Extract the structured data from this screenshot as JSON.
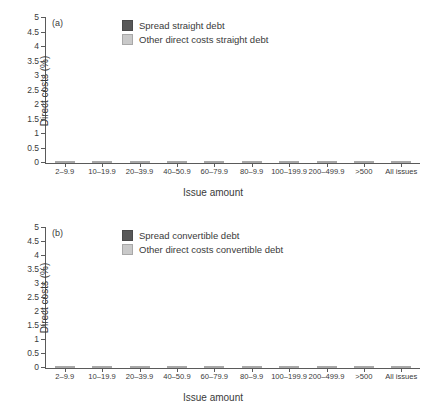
{
  "figure": {
    "background": "#ffffff",
    "colors": {
      "spread": "#585858",
      "other": "#c9c9c9",
      "axis": "#5a5a5a",
      "text": "#3a3a3a"
    },
    "top_cut_text": ""
  },
  "panels": [
    {
      "tag": "(a)",
      "legend": [
        {
          "label": "Spread straight debt",
          "color": "#585858",
          "key": "spread"
        },
        {
          "label": "Other direct costs straight debt",
          "color": "#c9c9c9",
          "key": "other"
        }
      ],
      "chart_data": {
        "type": "bar",
        "stacked": true,
        "title": "",
        "xlabel": "Issue amount",
        "ylabel": "Direct costs (%)",
        "ylim": [
          0,
          5
        ],
        "yticks": [
          "0",
          "0.5",
          "1",
          "1.5",
          "2",
          "2.5",
          "3",
          "3.5",
          "4",
          "4.5",
          "5"
        ],
        "grid": false,
        "legend_position": "top-center",
        "categories": [
          "2–9.9",
          "10–19.9",
          "20–39.9",
          "40–50.9",
          "60–79.9",
          "80–9.9",
          "100–199.9",
          "200–499.9",
          ">500",
          "All issues"
        ],
        "series": [
          {
            "name": "Spread straight debt",
            "color": "#585858",
            "values": [
              2.04,
              1.35,
              1.51,
              0.69,
              1.74,
              1.53,
              1.76,
              1.8,
              1.38,
              1.61
            ]
          },
          {
            "name": "Other direct costs straight debt",
            "color": "#c9c9c9",
            "values": [
              2.35,
              1.43,
              0.93,
              0.65,
              0.63,
              0.69,
              0.6,
              0.43,
              0.31,
              0.67
            ]
          }
        ],
        "totals": [
          4.39,
          2.78,
          2.44,
          1.34,
          2.37,
          2.22,
          2.36,
          2.23,
          1.69,
          2.28
        ]
      }
    },
    {
      "tag": "(b)",
      "legend": [
        {
          "label": "Spread convertible debt",
          "color": "#585858",
          "key": "spread"
        },
        {
          "label": "Other direct costs convertible debt",
          "color": "#c9c9c9",
          "key": "other"
        }
      ],
      "chart_data": {
        "type": "bar",
        "stacked": true,
        "title": "",
        "xlabel": "Issue amount",
        "ylabel": "Direct costs (%)",
        "ylim": [
          0,
          5
        ],
        "yticks": [
          "0",
          "0.5",
          "1",
          "1.5",
          "2",
          "2.5",
          "3",
          "3.5",
          "4",
          "4.5",
          "5"
        ],
        "grid": false,
        "legend_position": "top-center",
        "categories": [
          "2–9.9",
          "10–19.9",
          "20–39.9",
          "40–50.9",
          "60–79.9",
          "80–9.9",
          "100–199.9",
          "200–499.9",
          ">500",
          "All issues"
        ],
        "series": [
          {
            "name": "Spread convertible debt",
            "color": "#585858",
            "values": [
              2.84,
              2.55,
              1.92,
              1.49,
              1.18,
              1.1,
              1.05,
              0.93,
              0.94,
              1.34
            ]
          },
          {
            "name": "Other direct costs convertible debt",
            "color": "#c9c9c9",
            "values": [
              1.29,
              1.55,
              0.98,
              0.55,
              0.33,
              0.34,
              0.25,
              0.1,
              0.06,
              0.45
            ]
          }
        ],
        "totals": [
          4.13,
          4.1,
          2.9,
          2.04,
          1.51,
          1.44,
          1.3,
          1.03,
          1.0,
          1.79
        ]
      }
    }
  ]
}
